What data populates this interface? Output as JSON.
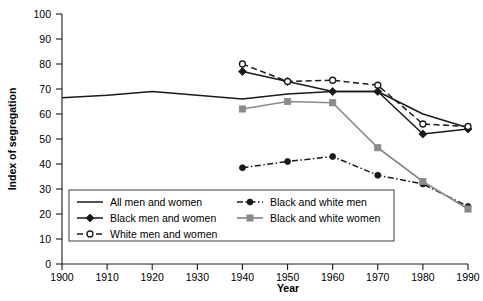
{
  "chart_data": {
    "type": "line",
    "title": "",
    "xlabel": "Year",
    "ylabel": "Index of segregation",
    "xlim": [
      1900,
      1990
    ],
    "ylim": [
      0,
      100
    ],
    "grid": false,
    "legend_position": "inside-bottom-left",
    "x_ticks": [
      1900,
      1910,
      1920,
      1930,
      1940,
      1950,
      1960,
      1970,
      1980,
      1990
    ],
    "y_ticks": [
      0,
      10,
      20,
      30,
      40,
      50,
      60,
      70,
      80,
      90,
      100
    ],
    "series": [
      {
        "name": "All men and women",
        "color": "#1a1a1a",
        "marker": "none",
        "dash": "solid",
        "x": [
          1900,
          1910,
          1920,
          1930,
          1940,
          1950,
          1960,
          1970,
          1980,
          1990
        ],
        "values": [
          66.5,
          67.5,
          69.0,
          67.5,
          66.0,
          68.0,
          69.0,
          69.0,
          60.0,
          54.5
        ]
      },
      {
        "name": "Black men and women",
        "color": "#1a1a1a",
        "marker": "diamond",
        "dash": "solid",
        "x": [
          1940,
          1950,
          1960,
          1970,
          1980,
          1990
        ],
        "values": [
          77.0,
          73.0,
          69.0,
          69.0,
          52.0,
          54.0
        ]
      },
      {
        "name": "White men and women",
        "color": "#1a1a1a",
        "marker": "open-circle",
        "dash": "dashed",
        "x": [
          1940,
          1950,
          1960,
          1970,
          1980,
          1990
        ],
        "values": [
          80.0,
          73.0,
          73.5,
          71.5,
          56.0,
          55.0
        ]
      },
      {
        "name": "Black and white men",
        "color": "#1a1a1a",
        "marker": "filled-circle",
        "dash": "dash-dot",
        "x": [
          1940,
          1950,
          1960,
          1970,
          1980,
          1990
        ],
        "values": [
          38.5,
          41.0,
          43.0,
          35.5,
          32.0,
          23.0
        ]
      },
      {
        "name": "Black and white women",
        "color": "#8a8a8a",
        "marker": "filled-square",
        "dash": "solid",
        "x": [
          1940,
          1950,
          1960,
          1970,
          1980,
          1990
        ],
        "values": [
          62.0,
          65.0,
          64.5,
          46.5,
          33.0,
          22.0
        ]
      }
    ]
  },
  "axes": {
    "x_title": "Year",
    "y_title": "Index of segregation",
    "x_tick_labels": [
      "1900",
      "1910",
      "1920",
      "1930",
      "1940",
      "1950",
      "1960",
      "1970",
      "1980",
      "1990"
    ],
    "y_tick_labels": [
      "0",
      "10",
      "20",
      "30",
      "40",
      "50",
      "60",
      "70",
      "80",
      "90",
      "100"
    ]
  },
  "legend": {
    "entries": [
      {
        "label": "All men and women",
        "marker": "none",
        "dash": "solid",
        "color": "#1a1a1a"
      },
      {
        "label": "Black and white men",
        "marker": "filled-circle",
        "dash": "dash-dot",
        "color": "#1a1a1a"
      },
      {
        "label": "Black men and women",
        "marker": "diamond",
        "dash": "solid",
        "color": "#1a1a1a"
      },
      {
        "label": "Black and white women",
        "marker": "filled-square",
        "dash": "solid",
        "color": "#8a8a8a"
      },
      {
        "label": "White men and women",
        "marker": "open-circle",
        "dash": "dashed",
        "color": "#1a1a1a"
      }
    ]
  }
}
